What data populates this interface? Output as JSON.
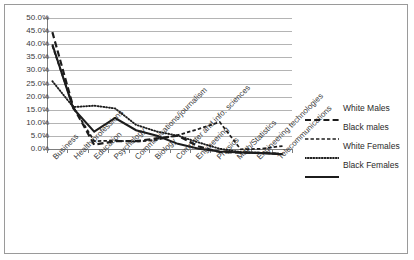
{
  "chart_data": {
    "type": "line",
    "title": "",
    "xlabel": "",
    "ylabel": "",
    "ylim": [
      0,
      50
    ],
    "ytick_step": 5,
    "ytick_labels": [
      "50.0%",
      "45.0%",
      "40.0%",
      "35.0%",
      "30.0%",
      "25.0%",
      "20.0%",
      "15.0%",
      "10.0%",
      "5.0%",
      "0.0%"
    ],
    "ytick_values": [
      50,
      45,
      40,
      35,
      30,
      25,
      20,
      15,
      10,
      5,
      0
    ],
    "grid": true,
    "legend_position": "right",
    "categories": [
      "Business",
      "Health professions",
      "Education",
      "Psychology",
      "Communications/journalism",
      "Biology",
      "Computer and info. sciences",
      "Engineering",
      "Physics",
      "Math/Statistics",
      "Engineering technologies",
      "Telecommunications"
    ],
    "series": [
      {
        "name": "White Males",
        "style": "dashed",
        "values": [
          45.0,
          17.5,
          3.7,
          5.0,
          5.0,
          6.0,
          7.0,
          3.0,
          1.0,
          0.8,
          0.7,
          0.3
        ]
      },
      {
        "name": "Black males",
        "style": "fine-dashed",
        "values": [
          40.0,
          17.5,
          5.0,
          5.2,
          4.8,
          5.5,
          7.2,
          9.5,
          12.0,
          2.0,
          2.2,
          3.2
        ]
      },
      {
        "name": "White Females",
        "style": "dotted",
        "values": [
          27.0,
          17.5,
          18.0,
          17.0,
          11.0,
          8.5,
          7.0,
          4.5,
          2.2,
          1.0,
          0.7,
          0.3
        ]
      },
      {
        "name": "Black Females",
        "style": "solid",
        "values": [
          40.5,
          17.0,
          8.5,
          13.5,
          9.0,
          7.0,
          4.0,
          2.2,
          1.2,
          0.8,
          0.6,
          0.2
        ]
      }
    ]
  },
  "legend": {
    "items": [
      {
        "label": "White Males",
        "style": "dashed"
      },
      {
        "label": "Black males",
        "style": "fine-dashed"
      },
      {
        "label": "White Females",
        "style": "dotted"
      },
      {
        "label": "Black Females",
        "style": "solid"
      }
    ]
  },
  "colors": {
    "line": "#1c1c1c",
    "grid": "#b4b4b4",
    "axis": "#7d7d7d",
    "text": "#3a3a3a",
    "border": "#9a9a9a",
    "background": "#ffffff"
  }
}
